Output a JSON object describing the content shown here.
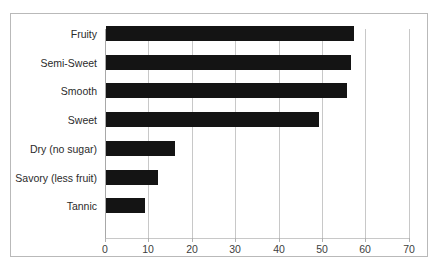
{
  "chart_data": {
    "type": "bar",
    "orientation": "horizontal",
    "title": "",
    "subtitle": "",
    "xlabel": "",
    "ylabel": "",
    "categories": [
      "Fruity",
      "Semi-Sweet",
      "Smooth",
      "Sweet",
      "Dry (no sugar)",
      "Savory (less fruit)",
      "Tannic"
    ],
    "values": [
      57,
      56.5,
      55.5,
      49,
      16,
      12,
      9
    ],
    "xticks": [
      "0",
      "10",
      "20",
      "30",
      "40",
      "50",
      "60",
      "70"
    ],
    "xtickvalues": [
      0,
      10,
      20,
      30,
      40,
      50,
      60,
      70
    ],
    "xlim": [
      0,
      70
    ],
    "grid": "vertical",
    "legend": "none",
    "bar_color": "#141414",
    "grid_color": "#c8c8c8",
    "border_color": "#b9b9b9",
    "background": "#ffffff"
  }
}
